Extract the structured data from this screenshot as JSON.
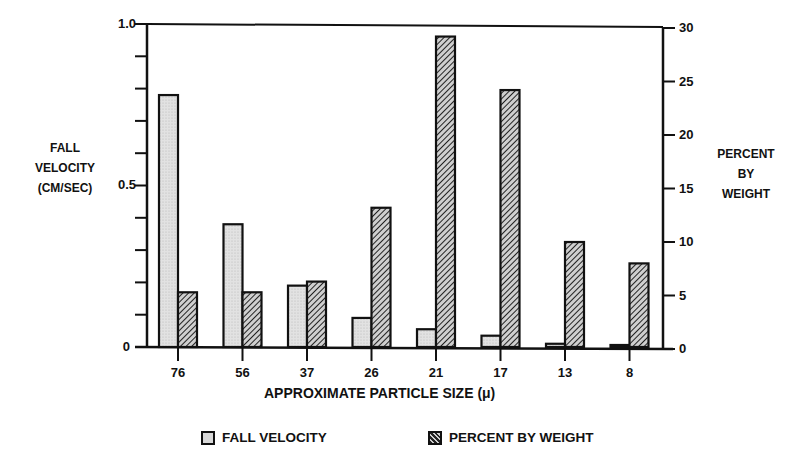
{
  "chart_data": {
    "type": "bar",
    "title": "",
    "xlabel": "APPROXIMATE PARTICLE SIZE (μ)",
    "ylabel_left": [
      "FALL",
      "VELOCITY",
      "(CM/SEC)"
    ],
    "ylabel_right": [
      "PERCENT",
      "BY",
      "WEIGHT"
    ],
    "categories": [
      "76",
      "56",
      "37",
      "26",
      "21",
      "17",
      "13",
      "8"
    ],
    "series": [
      {
        "name": "FALL VELOCITY",
        "axis": "left",
        "unit": "cm/sec",
        "values": [
          0.78,
          0.38,
          0.19,
          0.09,
          0.055,
          0.035,
          0.01,
          0.003
        ]
      },
      {
        "name": "PERCENT BY WEIGHT",
        "axis": "right",
        "unit": "%",
        "values": [
          5.3,
          5.3,
          6.3,
          13.2,
          29.2,
          24.2,
          10.0,
          8.0
        ]
      }
    ],
    "ylim_left": [
      0,
      1.0
    ],
    "ylim_right": [
      0,
      30
    ],
    "left_tick_labels": [
      "0",
      "0.5",
      "1.0"
    ],
    "left_minor_ticks": 10,
    "right_tick_labels": [
      "0",
      "5",
      "10",
      "15",
      "20",
      "25",
      "30"
    ],
    "grid": false,
    "legend_position": "bottom"
  },
  "axes": {
    "left_labels": {
      "top": "1.0",
      "mid": "0.5",
      "bottom": "0"
    },
    "right_labels": [
      "0",
      "5",
      "10",
      "15",
      "20",
      "25",
      "30"
    ]
  },
  "legend": {
    "fall_velocity": "FALL VELOCITY",
    "percent_by_weight": "PERCENT BY WEIGHT"
  },
  "labels": {
    "xlabel": "APPROXIMATE PARTICLE SIZE (μ)",
    "left_1": "FALL",
    "left_2": "VELOCITY",
    "left_3": "(CM/SEC)",
    "right_1": "PERCENT",
    "right_2": "BY",
    "right_3": "WEIGHT"
  },
  "colors": {
    "ink": "#111111",
    "fall_velocity_fill": "#d8d8d8",
    "hatch_dark": "#222222",
    "hatch_light": "#cfcfcf"
  }
}
